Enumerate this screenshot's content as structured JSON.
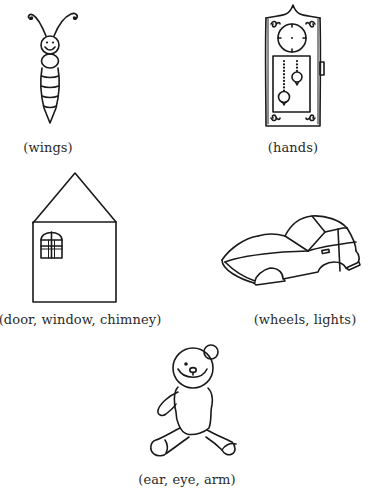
{
  "worksheet": {
    "items": [
      {
        "subject": "insect",
        "icon": "insect-drawing-icon",
        "caption": "(wings)"
      },
      {
        "subject": "clock",
        "icon": "grandfather-clock-drawing-icon",
        "caption": "(hands)"
      },
      {
        "subject": "house",
        "icon": "house-drawing-icon",
        "caption": "(door, window, chimney)"
      },
      {
        "subject": "car",
        "icon": "car-drawing-icon",
        "caption": "(wheels, lights)"
      },
      {
        "subject": "teddy bear",
        "icon": "teddy-bear-drawing-icon",
        "caption": "(ear, eye, arm)"
      }
    ]
  },
  "colors": {
    "background": "#ffffff",
    "ink": "#1a1a1a",
    "caption_text": "#2a2a2a"
  }
}
